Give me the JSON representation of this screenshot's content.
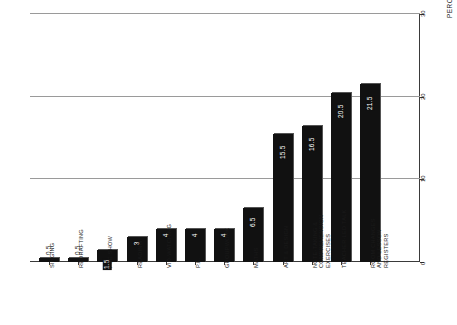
{
  "chart_data": {
    "type": "bar",
    "title": "",
    "subtitle": "",
    "xlabel": "",
    "ylabel": "PERCENTAGE OF TIMETABLED WEEK",
    "ylim": [
      0,
      30
    ],
    "yticks": [
      0,
      10,
      20,
      30
    ],
    "ytick_labels": [
      "0",
      "10",
      "20",
      "30"
    ],
    "grid": true,
    "grid_axis": "y",
    "legend": false,
    "orientation": "vertical-bars-rotated-page",
    "categories": [
      "SINGING",
      "REDRAFTING",
      "PSE SHOW",
      "READING",
      "VID-WATCHING",
      "P.E.",
      "GROUPWORK",
      "MATHS",
      "ART & DESIGN",
      "NOTE-TAKING & COMPREHENSION EXERCISES",
      "TEACHER-LED TALK",
      "ROOM CHANGES AND LESSON REGISTERS"
    ],
    "values": [
      0.5,
      0.5,
      1.5,
      3,
      4,
      4,
      4,
      6.5,
      15.5,
      16.5,
      20.5,
      21.5
    ],
    "value_labels": [
      "0.5",
      "0.5",
      "1.5",
      "3",
      "4",
      "4",
      "4",
      "6.5",
      "15.5",
      "16.5",
      "20.5",
      "21.5"
    ],
    "label_placement": [
      "outside",
      "outside",
      "inside",
      "inside",
      "inside",
      "inside",
      "inside",
      "inside",
      "inside",
      "inside",
      "inside",
      "inside"
    ],
    "bar_color": "#111111",
    "grid_color": "#9a9a9a",
    "axis_color": "#3a3a3a",
    "background_color": "#ffffff"
  },
  "axis": {
    "y_title": "PERCENTAGE OF TIMETABLED WEEK"
  }
}
